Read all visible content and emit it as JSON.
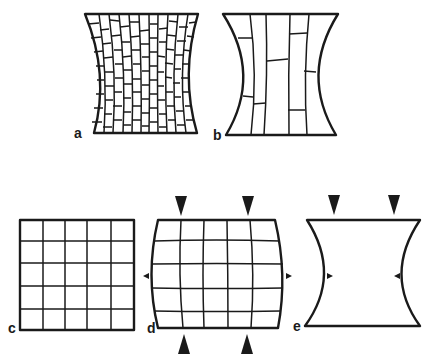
{
  "figure": {
    "panels": [
      {
        "id": "a",
        "label": "a",
        "description": "Concave-sided (hourglass) tissue with many small brick-like cells"
      },
      {
        "id": "b",
        "label": "b",
        "description": "Concave-sided (hourglass) tissue with few long elongated cells"
      },
      {
        "id": "c",
        "label": "c",
        "description": "Square 5x5 grid, undeformed"
      },
      {
        "id": "d",
        "label": "d",
        "description": "5x5 grid with convex bulging sides under vertical compression arrows; small outward arrowheads at sides"
      },
      {
        "id": "e",
        "label": "e",
        "description": "Concave-sided outline under vertical compression arrows; small inward arrowheads at sides"
      }
    ],
    "colors": {
      "ink": "#1a1a1a",
      "background": "#ffffff"
    }
  }
}
